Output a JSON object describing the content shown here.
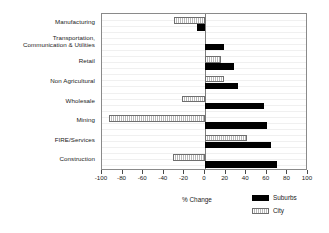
{
  "chart_data": {
    "type": "bar",
    "orientation": "horizontal",
    "title": "",
    "xlabel": "% Change",
    "ylabel": "",
    "xlim": [
      -100,
      100
    ],
    "xticks": [
      -100,
      -80,
      -60,
      -40,
      -20,
      0,
      20,
      40,
      60,
      80,
      100
    ],
    "xtick_labels": [
      "-100",
      "-80",
      "-60",
      "-40",
      "-20",
      "0",
      "20",
      "40",
      "60",
      "80",
      "100"
    ],
    "grid": true,
    "grid_axis": "y",
    "legend_position": "bottom-right",
    "categories": [
      "Manufacturing",
      "Transportation,\nCommunication & Utilities",
      "Retail",
      "Non Agricultural",
      "Wholesale",
      "Mining",
      "FIRE/Services",
      "Construction"
    ],
    "series": [
      {
        "name": "Suburbs",
        "color": "#000000",
        "values": [
          -8,
          18,
          28,
          32,
          57,
          60,
          64,
          70
        ]
      },
      {
        "name": "City",
        "color": "#e8e8e8",
        "values": [
          -30,
          0,
          16,
          18,
          -22,
          -93,
          41,
          -31
        ]
      }
    ]
  },
  "legend": {
    "items": [
      {
        "label": "Suburbs",
        "swatch": "black-solid"
      },
      {
        "label": "City",
        "swatch": "light-hatched"
      }
    ]
  },
  "axis": {
    "x_title": "% Change"
  }
}
